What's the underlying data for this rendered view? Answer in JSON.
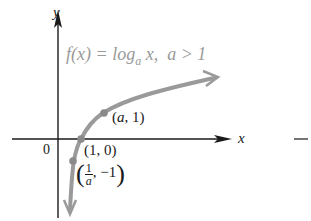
{
  "diagram": {
    "type": "function-graph",
    "title": {
      "func": "f(x) = log",
      "base": "a",
      "arg": " x,",
      "condition": "a > 1"
    },
    "axes": {
      "x_label": "x",
      "y_label": "y",
      "origin_label": "0"
    },
    "points": [
      {
        "label": "(a, 1)",
        "x_text": "a",
        "y_text": "1"
      },
      {
        "label": "(1, 0)"
      },
      {
        "label": "(1/a, -1)",
        "num": "1",
        "den": "a",
        "y_text": "−1"
      }
    ],
    "extra_mark": "—",
    "colors": {
      "curve": "#9a9a9a",
      "axes": "#1a1a1a",
      "title": "#9a9a9a"
    }
  }
}
